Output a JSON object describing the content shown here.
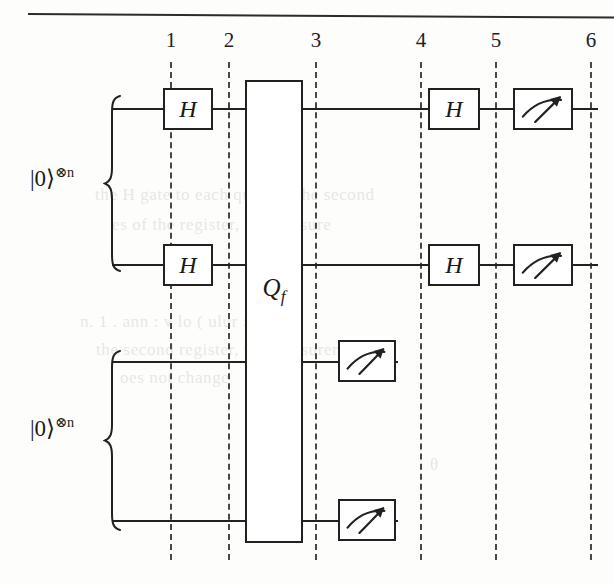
{
  "figure": {
    "type": "quantum-circuit-diagram",
    "ink_color": "#23211f",
    "background_color": "#fdfdfc",
    "dash_color": "#4a4744"
  },
  "column_markers": {
    "labels": [
      "1",
      "2",
      "3",
      "4",
      "5",
      "6"
    ],
    "x_positions": [
      170,
      228,
      315,
      420,
      495,
      590
    ],
    "label_y": 42,
    "line_top": 62,
    "line_bottom": 560
  },
  "registers": [
    {
      "name": "upper-register",
      "ket_label": "|0⟩",
      "ket_exponent": "⊗n",
      "label_x": 30,
      "label_y": 178,
      "brace_top": 95,
      "brace_bottom": 272,
      "brace_x": 103,
      "wires": [
        {
          "name": "wire-1",
          "y": 108,
          "x_start": 112,
          "x_end": 598
        },
        {
          "name": "wire-2",
          "y": 264,
          "x_start": 112,
          "x_end": 598
        }
      ]
    },
    {
      "name": "lower-register",
      "ket_label": "|0⟩",
      "ket_exponent": "⊗n",
      "label_x": 30,
      "label_y": 428,
      "brace_top": 350,
      "brace_bottom": 531,
      "brace_x": 103,
      "wires": [
        {
          "name": "wire-3",
          "y": 361,
          "x_start": 112,
          "x_end": 398
        },
        {
          "name": "wire-4",
          "y": 520,
          "x_start": 112,
          "x_end": 398
        }
      ]
    }
  ],
  "gates": [
    {
      "name": "hadamard-gate-wire1-col1",
      "kind": "hadamard",
      "label": "H",
      "x": 163,
      "y": 88,
      "w": 50,
      "h": 42
    },
    {
      "name": "hadamard-gate-wire2-col1",
      "kind": "hadamard",
      "label": "H",
      "x": 163,
      "y": 244,
      "w": 50,
      "h": 42
    },
    {
      "name": "hadamard-gate-wire1-col4",
      "kind": "hadamard",
      "label": "H",
      "x": 428,
      "y": 88,
      "w": 52,
      "h": 42
    },
    {
      "name": "hadamard-gate-wire2-col4",
      "kind": "hadamard",
      "label": "H",
      "x": 428,
      "y": 244,
      "w": 52,
      "h": 42
    }
  ],
  "oracle": {
    "name": "oracle-gate",
    "label_base": "Q",
    "label_sub": "f",
    "x": 245,
    "y": 80,
    "w": 58,
    "h": 463,
    "label_y": 290
  },
  "measurements": [
    {
      "name": "measurement-gate-wire1",
      "x": 513,
      "y": 88,
      "w": 60,
      "h": 42
    },
    {
      "name": "measurement-gate-wire2",
      "x": 513,
      "y": 244,
      "w": 60,
      "h": 42
    },
    {
      "name": "measurement-gate-wire3",
      "x": 338,
      "y": 340,
      "w": 58,
      "h": 42
    },
    {
      "name": "measurement-gate-wire4",
      "x": 338,
      "y": 499,
      "w": 58,
      "h": 42
    }
  ],
  "background_text": [
    {
      "text": "λ",
      "x": 200,
      "y": 85
    },
    {
      "text": "the H gate to each qubit of the second",
      "x": 95,
      "y": 185
    },
    {
      "text": "es of the register, we measure",
      "x": 112,
      "y": 215
    },
    {
      "text": "n.  1 .  ann         : v  lo ( ulur    : .  n .",
      "x": 80,
      "y": 312
    },
    {
      "text": "the second register, the measurement",
      "x": 96,
      "y": 340
    },
    {
      "text": "oes not change",
      "x": 120,
      "y": 368
    },
    {
      "text": "θ",
      "x": 430,
      "y": 455
    }
  ]
}
